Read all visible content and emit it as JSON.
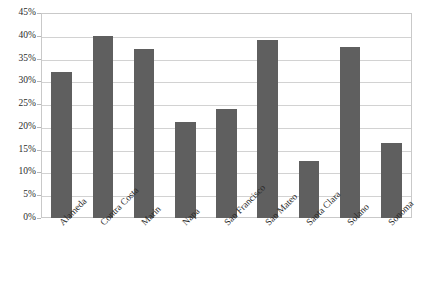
{
  "chart_data": {
    "type": "bar",
    "title": "",
    "subtitle": "",
    "xlabel": "",
    "ylabel": "",
    "categories": [
      "Alameda",
      "Contra Costa",
      "Marin",
      "Napa",
      "San Francisco",
      "San Mateo",
      "Santa Clara",
      "Solano",
      "Sonoma"
    ],
    "values": [
      32,
      40,
      37,
      21,
      24,
      39,
      12.5,
      37.5,
      16.5
    ],
    "value_unit": "%",
    "ylim": [
      0,
      45
    ],
    "ytick_values": [
      0,
      5,
      10,
      15,
      20,
      25,
      30,
      35,
      40,
      45
    ],
    "ytick_labels": [
      "0%",
      "5%",
      "10%",
      "15%",
      "20%",
      "25%",
      "30%",
      "35%",
      "40%",
      "45%"
    ],
    "grid": true,
    "legend": false,
    "legend_position": "none",
    "bar_color": "#5f5f5f",
    "gridline_color": "#d2d2d2",
    "border_color": "#c9c9c9",
    "background_color": "#ffffff",
    "xlabel_rotation_deg": -45
  }
}
